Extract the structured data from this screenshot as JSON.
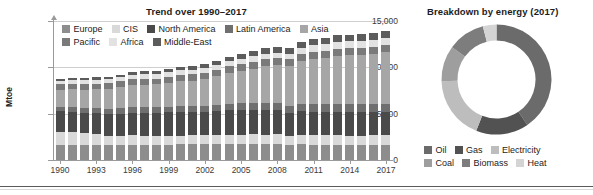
{
  "figure": {
    "background": "#ffffff",
    "divider_color": "#5a5a5a"
  },
  "left_panel": {
    "title": "Trend over 1990–2017",
    "ylabel": "Mtoe"
  },
  "right_panel": {
    "title": "Breakdown by energy (2017)"
  },
  "chart_data": [
    {
      "type": "bar",
      "stacked": true,
      "title": "Trend over 1990–2017",
      "xlabel": "",
      "ylabel": "Mtoe",
      "ylim": [
        0,
        15000
      ],
      "yticks": [
        0,
        5000,
        10000,
        15000
      ],
      "ytick_labels": [
        "0",
        "5,000",
        "10,000",
        "15,000"
      ],
      "grid": true,
      "legend_position": "inside-top-left",
      "x": [
        1990,
        1991,
        1992,
        1993,
        1994,
        1995,
        1996,
        1997,
        1998,
        1999,
        2000,
        2001,
        2002,
        2003,
        2004,
        2005,
        2006,
        2007,
        2008,
        2009,
        2010,
        2011,
        2012,
        2013,
        2014,
        2015,
        2016,
        2017
      ],
      "xtick_labels": [
        "1990",
        "1993",
        "1996",
        "1999",
        "2002",
        "2005",
        "2008",
        "2011",
        "2014",
        "2017"
      ],
      "categories": [
        "1990",
        "1991",
        "1992",
        "1993",
        "1994",
        "1995",
        "1996",
        "1997",
        "1998",
        "1999",
        "2000",
        "2001",
        "2002",
        "2003",
        "2004",
        "2005",
        "2006",
        "2007",
        "2008",
        "2009",
        "2010",
        "2011",
        "2012",
        "2013",
        "2014",
        "2015",
        "2016",
        "2017"
      ],
      "series": [
        {
          "name": "Europe",
          "color": "#8d8d8d",
          "values": [
            1650,
            1640,
            1610,
            1600,
            1590,
            1620,
            1660,
            1650,
            1660,
            1660,
            1680,
            1700,
            1700,
            1720,
            1740,
            1750,
            1740,
            1720,
            1720,
            1630,
            1690,
            1640,
            1630,
            1630,
            1580,
            1600,
            1620,
            1630
          ]
        },
        {
          "name": "CIS",
          "color": "#d9d9d9",
          "values": [
            1420,
            1380,
            1270,
            1160,
            1050,
            1010,
            1010,
            960,
            930,
            950,
            960,
            970,
            960,
            980,
            990,
            1000,
            1030,
            1030,
            1040,
            980,
            1030,
            1060,
            1070,
            1050,
            1030,
            1020,
            1040,
            1060
          ]
        },
        {
          "name": "North America",
          "color": "#4a4a4a",
          "values": [
            2190,
            2190,
            2240,
            2300,
            2340,
            2390,
            2450,
            2470,
            2480,
            2520,
            2590,
            2540,
            2560,
            2590,
            2640,
            2650,
            2620,
            2660,
            2600,
            2470,
            2540,
            2510,
            2460,
            2500,
            2530,
            2520,
            2510,
            2520
          ]
        },
        {
          "name": "Latin America",
          "color": "#6f6f6f",
          "values": [
            470,
            480,
            490,
            510,
            530,
            550,
            580,
            600,
            620,
            630,
            650,
            650,
            650,
            660,
            690,
            710,
            730,
            760,
            780,
            780,
            830,
            850,
            870,
            890,
            900,
            890,
            880,
            880
          ]
        },
        {
          "name": "Asia",
          "color": "#a6a6a6",
          "values": [
            1870,
            1940,
            2000,
            2100,
            2180,
            2290,
            2400,
            2470,
            2470,
            2560,
            2650,
            2720,
            2850,
            3090,
            3350,
            3540,
            3750,
            3960,
            4080,
            4280,
            4620,
            4890,
            5020,
            5190,
            5270,
            5290,
            5390,
            5520
          ]
        },
        {
          "name": "Pacific",
          "color": "#7a7a7a",
          "values": [
            560,
            570,
            580,
            590,
            600,
            620,
            640,
            650,
            640,
            660,
            680,
            680,
            690,
            700,
            720,
            730,
            740,
            750,
            750,
            730,
            760,
            760,
            760,
            760,
            760,
            760,
            770,
            780
          ]
        },
        {
          "name": "Africa",
          "color": "#e2e2e2",
          "values": [
            390,
            400,
            405,
            410,
            420,
            430,
            440,
            450,
            460,
            470,
            480,
            490,
            505,
            520,
            540,
            560,
            575,
            595,
            615,
            630,
            650,
            670,
            690,
            710,
            730,
            745,
            760,
            775
          ]
        },
        {
          "name": "Middle-East",
          "color": "#5c5c5c",
          "values": [
            240,
            255,
            270,
            285,
            300,
            315,
            330,
            345,
            360,
            380,
            400,
            420,
            440,
            465,
            490,
            515,
            540,
            570,
            600,
            625,
            655,
            680,
            700,
            720,
            740,
            755,
            770,
            785
          ]
        }
      ]
    },
    {
      "type": "pie",
      "variant": "donut",
      "title": "Breakdown by energy (2017)",
      "legend_position": "bottom",
      "labels": [
        "Oil",
        "Gas",
        "Electricity",
        "Coal",
        "Biomass",
        "Heat"
      ],
      "values": [
        40.5,
        15.5,
        18.5,
        10.5,
        11.0,
        4.0
      ],
      "colors": [
        "#6b6b6b",
        "#525252",
        "#bdbdbd",
        "#9e9e9e",
        "#7d7d7d",
        "#d4d4d4"
      ]
    }
  ]
}
